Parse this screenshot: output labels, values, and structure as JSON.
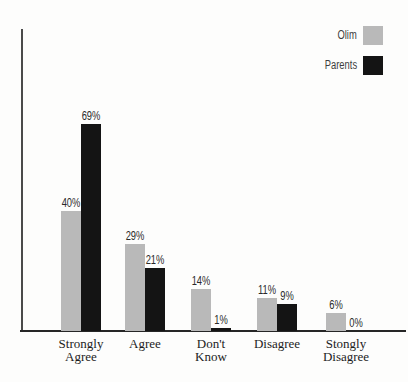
{
  "chart_data": {
    "type": "bar",
    "title": "",
    "xlabel": "",
    "ylabel": "",
    "categories": [
      "Strongly Agree",
      "Agree",
      "Don't Know",
      "Disagree",
      "Stongly Disagree"
    ],
    "category_label_lines": [
      [
        "Strongly",
        "Agree"
      ],
      [
        "Agree"
      ],
      [
        "Don't",
        "Know"
      ],
      [
        "Disagree"
      ],
      [
        "Stongly",
        "Disagree"
      ]
    ],
    "series": [
      {
        "name": "Olim",
        "color": "#b9b9b9",
        "values": [
          40,
          29,
          14,
          11,
          6
        ]
      },
      {
        "name": "Parents",
        "color": "#141414",
        "values": [
          69,
          21,
          1,
          9,
          0
        ]
      }
    ],
    "value_suffix": "%",
    "ylim": [
      0,
      100
    ],
    "grid": false,
    "y_ticks": [],
    "legend_position": "top-right",
    "colors": {
      "olim_bar": "#b9b9b9",
      "parents_bar": "#141414",
      "axis": "#262626",
      "text": "#2a2a2a"
    }
  }
}
